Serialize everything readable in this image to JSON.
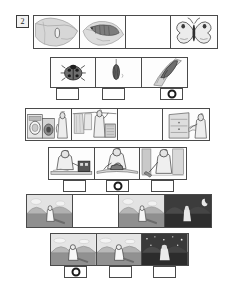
{
  "exercise": {
    "number": "2"
  },
  "colors": {
    "ink": "#4a4a4a",
    "paper": "#ffffff",
    "grey_light": "#d9d9d9",
    "grey_mid": "#9a9a9a",
    "grey_dark": "#6b6b6b",
    "night": "#3b3b3b",
    "marker": "#1a1a1a"
  },
  "rows": [
    {
      "id": "row-1",
      "name": "caterpillar-lifecycle-top",
      "has_answer_boxes": false,
      "cells": [
        {
          "name": "leaf-with-egg-illustration",
          "kind": "image",
          "subject": "leaf-with-egg",
          "shade": "light"
        },
        {
          "name": "caterpillar-on-leaf-illustration",
          "kind": "image",
          "subject": "caterpillar-on-leaf",
          "shade": "light"
        },
        {
          "name": "blank-cell",
          "kind": "empty",
          "subject": "",
          "shade": "paper"
        },
        {
          "name": "butterfly-illustration",
          "kind": "image",
          "subject": "butterfly",
          "shade": "light"
        }
      ]
    },
    {
      "id": "row-2",
      "name": "ladybird-lifecycle",
      "has_answer_boxes": true,
      "cells": [
        {
          "name": "ladybird-illustration",
          "kind": "image",
          "subject": "ladybird",
          "shade": "light"
        },
        {
          "name": "pupa-hanging-illustration",
          "kind": "image",
          "subject": "pupa-hanging",
          "shade": "light"
        },
        {
          "name": "emerging-insect-illustration",
          "kind": "image",
          "subject": "emerging-insect",
          "shade": "light"
        }
      ],
      "answers": [
        {
          "name": "answer-box-1",
          "marked": false
        },
        {
          "name": "answer-box-2",
          "marked": false
        },
        {
          "name": "answer-box-3",
          "marked": true
        }
      ]
    },
    {
      "id": "row-3",
      "name": "household-chores-top",
      "has_answer_boxes": false,
      "cells": [
        {
          "name": "washing-machine-scene",
          "kind": "image",
          "subject": "washing-machine",
          "shade": "light"
        },
        {
          "name": "hanging-laundry-scene",
          "kind": "image",
          "subject": "hanging-laundry",
          "shade": "light"
        },
        {
          "name": "blank-cell",
          "kind": "empty",
          "subject": "",
          "shade": "paper"
        },
        {
          "name": "putting-away-clothes-scene",
          "kind": "image",
          "subject": "putting-away-clothes",
          "shade": "light"
        }
      ]
    },
    {
      "id": "row-4",
      "name": "household-chores-bottom",
      "has_answer_boxes": true,
      "cells": [
        {
          "name": "sewing-machine-scene",
          "kind": "image",
          "subject": "sewing-machine",
          "shade": "light"
        },
        {
          "name": "ironing-scene",
          "kind": "image",
          "subject": "ironing",
          "shade": "light"
        },
        {
          "name": "sweeping-scene",
          "kind": "image",
          "subject": "sweeping",
          "shade": "light"
        }
      ],
      "answers": [
        {
          "name": "answer-box-1",
          "marked": false
        },
        {
          "name": "answer-box-2",
          "marked": true
        },
        {
          "name": "answer-box-3",
          "marked": false
        }
      ]
    },
    {
      "id": "row-5",
      "name": "day-to-night-top",
      "has_answer_boxes": false,
      "cells": [
        {
          "name": "daytime-hill-scene",
          "kind": "image",
          "subject": "day-hill",
          "shade": "light"
        },
        {
          "name": "blank-cell",
          "kind": "empty",
          "subject": "",
          "shade": "paper"
        },
        {
          "name": "daytime-hill-scene",
          "kind": "image",
          "subject": "day-hill",
          "shade": "light"
        },
        {
          "name": "night-hill-scene",
          "kind": "image",
          "subject": "night-hill",
          "shade": "dark"
        }
      ]
    },
    {
      "id": "row-6",
      "name": "day-to-night-bottom",
      "has_answer_boxes": true,
      "cells": [
        {
          "name": "morning-hill-scene",
          "kind": "image",
          "subject": "day-hill",
          "shade": "light"
        },
        {
          "name": "afternoon-hill-scene",
          "kind": "image",
          "subject": "day-hill",
          "shade": "light"
        },
        {
          "name": "starry-night-hill-scene",
          "kind": "image",
          "subject": "night-hill-stars",
          "shade": "dark"
        }
      ],
      "answers": [
        {
          "name": "answer-box-1",
          "marked": true
        },
        {
          "name": "answer-box-2",
          "marked": false
        },
        {
          "name": "answer-box-3",
          "marked": false
        }
      ]
    }
  ]
}
